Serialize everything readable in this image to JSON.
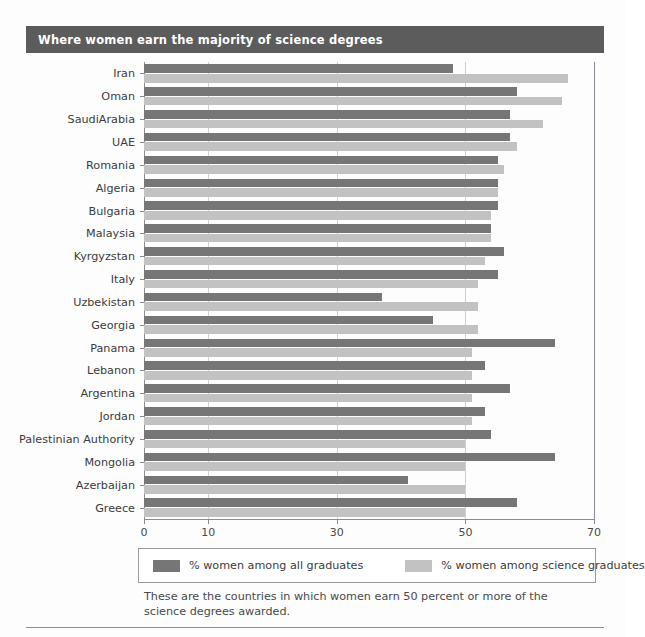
{
  "title": "Where women earn the majority of science degrees",
  "caption": "These are the countries in which women earn 50 percent or more of the science degrees awarded.",
  "legend": {
    "series_all_label": "% women among all graduates",
    "series_sci_label": "% women among science graduates",
    "color_all": "#767676",
    "color_sci": "#c2c2c2"
  },
  "chart_data": {
    "type": "bar",
    "orientation": "horizontal",
    "title": "Where women earn the majority of science degrees",
    "xlabel": "",
    "ylabel": "",
    "xlim": [
      0,
      70
    ],
    "xticks": [
      0,
      10,
      30,
      50,
      70
    ],
    "xtick_labels": [
      "0",
      "10",
      "30",
      "50",
      "70"
    ],
    "grid": true,
    "legend_position": "below",
    "categories": [
      "Iran",
      "Oman",
      "SaudiArabia",
      "UAE",
      "Romania",
      "Algeria",
      "Bulgaria",
      "Malaysia",
      "Kyrgyzstan",
      "Italy",
      "Uzbekistan",
      "Georgia",
      "Panama",
      "Lebanon",
      "Argentina",
      "Jordan",
      "Palestinian Authority",
      "Mongolia",
      "Azerbaijan",
      "Greece"
    ],
    "series": [
      {
        "name": "% women among all graduates",
        "color": "#767676",
        "values": [
          48,
          58,
          57,
          57,
          55,
          55,
          55,
          54,
          56,
          55,
          37,
          45,
          64,
          53,
          57,
          53,
          54,
          64,
          41,
          58
        ]
      },
      {
        "name": "% women among science graduates",
        "color": "#c2c2c2",
        "values": [
          66,
          65,
          62,
          58,
          56,
          55,
          54,
          54,
          53,
          52,
          52,
          52,
          51,
          51,
          51,
          51,
          50,
          50,
          50,
          50
        ]
      }
    ]
  }
}
